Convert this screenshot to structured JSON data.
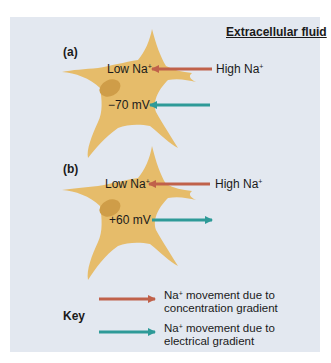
{
  "title": "Extracellular fluid",
  "colors": {
    "background": "#e3e8f0",
    "cell": "#e6bc6a",
    "nucleus": "#cf9d48",
    "concentration_arrow": "#c0614a",
    "electrical_arrow": "#2e9a98"
  },
  "panels": [
    {
      "label": "(a)",
      "inside_concentration": "Low Na",
      "inside_concentration_sup": "+",
      "outside_concentration": "High Na",
      "outside_concentration_sup": "+",
      "membrane_potential": "−70 mV",
      "electrical_arrow_direction": "inward"
    },
    {
      "label": "(b)",
      "inside_concentration": "Low Na",
      "inside_concentration_sup": "+",
      "outside_concentration": "High Na",
      "outside_concentration_sup": "+",
      "membrane_potential": "+60 mV",
      "electrical_arrow_direction": "outward"
    }
  ],
  "key": {
    "label": "Key",
    "items": [
      {
        "icon": "red-arrow-icon",
        "text_prefix": "Na",
        "sup": "+",
        "text_suffix": " movement due to concentration gradient"
      },
      {
        "icon": "teal-arrow-icon",
        "text_prefix": "Na",
        "sup": "+",
        "text_suffix": " movement due to electrical gradient"
      }
    ]
  }
}
